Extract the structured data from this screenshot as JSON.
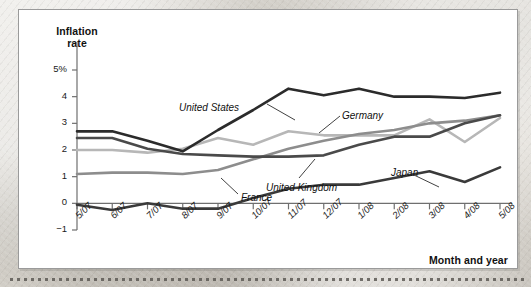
{
  "figure": {
    "y_axis_title": "Inflation\nrate",
    "y_axis_title_line1": "Inflation",
    "y_axis_title_line2": "rate",
    "x_axis_title": "Month and year"
  },
  "chart_data": {
    "type": "line",
    "title": "",
    "xlabel": "Month and year",
    "ylabel": "Inflation rate",
    "ylim": [
      -1,
      5.6
    ],
    "yticks": [
      5,
      4,
      3,
      2,
      1,
      0,
      -1
    ],
    "ytick_labels": [
      "5%",
      "4",
      "3",
      "2",
      "1",
      "0",
      "−1"
    ],
    "grid": false,
    "legend": "inline-annotations",
    "categories": [
      "5/07",
      "6/07",
      "7/07",
      "8/07",
      "9/07",
      "10/07",
      "11/07",
      "12/07",
      "1/08",
      "2/08",
      "3/08",
      "4/08",
      "5/08"
    ],
    "series": [
      {
        "name": "United States",
        "color": "#2b2b2b",
        "width": 2.6,
        "values": [
          2.7,
          2.7,
          2.35,
          1.95,
          2.75,
          3.5,
          4.3,
          4.05,
          4.3,
          4.0,
          4.0,
          3.95,
          4.15
        ],
        "label_x": 160,
        "label_y": 92,
        "label_anchor": "start"
      },
      {
        "name": "United Kingdom",
        "color": "#4a4a4a",
        "width": 2.6,
        "values": [
          2.45,
          2.45,
          2.05,
          1.85,
          1.8,
          1.75,
          1.75,
          1.8,
          2.2,
          2.5,
          2.5,
          3.0,
          3.3
        ],
        "label_x": 247,
        "label_y": 172,
        "label_anchor": "start"
      },
      {
        "name": "Germany",
        "color": "#b7b7b7",
        "width": 2.6,
        "values": [
          2.0,
          2.0,
          1.9,
          2.05,
          2.45,
          2.2,
          2.7,
          2.55,
          2.55,
          2.55,
          3.15,
          2.3,
          3.2
        ],
        "label_x": 323,
        "label_y": 100,
        "label_anchor": "start"
      },
      {
        "name": "France",
        "color": "#8d8d8d",
        "width": 2.6,
        "values": [
          1.1,
          1.15,
          1.15,
          1.1,
          1.25,
          1.65,
          2.05,
          2.35,
          2.6,
          2.75,
          3.0,
          3.1,
          3.3
        ],
        "label_x": 222,
        "label_y": 182,
        "label_anchor": "start"
      },
      {
        "name": "Japan",
        "color": "#3a3a3a",
        "width": 2.6,
        "values": [
          -0.05,
          -0.25,
          0.0,
          -0.2,
          -0.2,
          0.2,
          0.55,
          0.7,
          0.7,
          0.95,
          1.2,
          0.8,
          1.35
        ],
        "label_x": 372,
        "label_y": 157,
        "label_anchor": "start"
      }
    ],
    "annotations": [
      {
        "text": "United States",
        "leader_from": [
          248,
          94
        ],
        "leader_to": [
          276,
          110
        ]
      },
      {
        "text": "Germany",
        "leader_from": [
          321,
          106
        ],
        "leader_to": [
          300,
          123
        ]
      },
      {
        "text": "United Kingdom",
        "leader_from": [
          280,
          168
        ],
        "leader_to": [
          296,
          149
        ]
      },
      {
        "text": "France",
        "leader_from": [
          219,
          184
        ],
        "leader_to": [
          202,
          168
        ]
      },
      {
        "text": "Japan",
        "leader_from": [
          395,
          165
        ],
        "leader_to": [
          420,
          177
        ]
      }
    ]
  }
}
